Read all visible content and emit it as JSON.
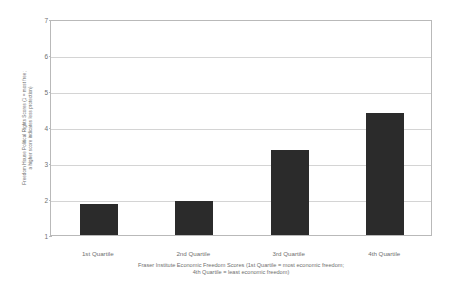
{
  "chart_data": {
    "type": "bar",
    "title": "",
    "categories": [
      "1st Quartile",
      "2nd Quartile",
      "3rd Quartile",
      "4th Quartile"
    ],
    "values": [
      1.85,
      1.95,
      3.35,
      4.4
    ],
    "series": [
      {
        "name": "Freedom House Political Rights Score",
        "values": [
          1.85,
          1.95,
          3.35,
          4.4
        ]
      }
    ],
    "ylabel_line1": "Freedom House Political Rights Scores (1 = most free;",
    "ylabel_line2": "a higher score indicates less protection)",
    "xlabel_line1": "Fraser Institute Economic Freedom Scores (1st Quartile = most economic freedom;",
    "xlabel_line2": "4th Quartile = least economic freedom)",
    "ylim": [
      1,
      7
    ],
    "yticks": [
      "1",
      "2",
      "3",
      "4",
      "5",
      "6",
      "7"
    ],
    "grid": true,
    "legend": "none",
    "bar_color": "#2b2b2b",
    "grid_color": "#d4d4d4",
    "frame_color": "#b9b9b9",
    "text_color": "#6f6f6f"
  }
}
